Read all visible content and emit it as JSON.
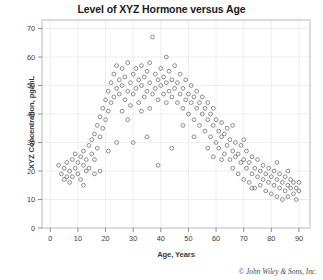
{
  "chart_data": {
    "type": "scatter",
    "title": "Level of XYZ Hormone versus Age",
    "xlabel": "Age, Years",
    "ylabel": "XYZ Concentration, pg/mL",
    "xlim": [
      -3,
      94
    ],
    "ylim": [
      0,
      73
    ],
    "xticks": [
      0,
      10,
      20,
      30,
      40,
      50,
      60,
      70,
      80,
      90
    ],
    "yticks": [
      0,
      10,
      20,
      30,
      40,
      50,
      60,
      70
    ],
    "grid": true,
    "legend": null,
    "marker": "open-circle",
    "marker_color": "#7a7a7a",
    "points": [
      [
        3,
        22
      ],
      [
        4,
        19
      ],
      [
        5,
        17
      ],
      [
        5,
        21
      ],
      [
        6,
        18
      ],
      [
        6,
        23
      ],
      [
        7,
        16
      ],
      [
        7,
        20
      ],
      [
        8,
        24
      ],
      [
        8,
        18
      ],
      [
        9,
        21
      ],
      [
        9,
        26
      ],
      [
        10,
        19
      ],
      [
        10,
        23
      ],
      [
        11,
        17
      ],
      [
        11,
        25
      ],
      [
        12,
        22
      ],
      [
        12,
        27
      ],
      [
        13,
        20
      ],
      [
        13,
        24
      ],
      [
        14,
        29
      ],
      [
        14,
        21
      ],
      [
        15,
        26
      ],
      [
        15,
        31
      ],
      [
        16,
        24
      ],
      [
        16,
        33
      ],
      [
        17,
        28
      ],
      [
        17,
        36
      ],
      [
        18,
        32
      ],
      [
        18,
        39
      ],
      [
        19,
        35
      ],
      [
        19,
        42
      ],
      [
        20,
        38
      ],
      [
        20,
        45
      ],
      [
        21,
        41
      ],
      [
        21,
        48
      ],
      [
        22,
        44
      ],
      [
        22,
        51
      ],
      [
        23,
        46
      ],
      [
        23,
        54
      ],
      [
        24,
        49
      ],
      [
        24,
        57
      ],
      [
        25,
        47
      ],
      [
        25,
        52
      ],
      [
        26,
        50
      ],
      [
        26,
        56
      ],
      [
        27,
        45
      ],
      [
        27,
        53
      ],
      [
        28,
        48
      ],
      [
        28,
        58
      ],
      [
        29,
        51
      ],
      [
        29,
        43
      ],
      [
        30,
        54
      ],
      [
        30,
        47
      ],
      [
        31,
        49
      ],
      [
        31,
        56
      ],
      [
        32,
        52
      ],
      [
        32,
        44
      ],
      [
        33,
        50
      ],
      [
        33,
        57
      ],
      [
        34,
        46
      ],
      [
        34,
        53
      ],
      [
        35,
        55
      ],
      [
        35,
        48
      ],
      [
        36,
        51
      ],
      [
        36,
        58
      ],
      [
        37,
        67
      ],
      [
        37,
        47
      ],
      [
        38,
        54
      ],
      [
        38,
        49
      ],
      [
        39,
        52
      ],
      [
        39,
        45
      ],
      [
        40,
        56
      ],
      [
        40,
        50
      ],
      [
        41,
        47
      ],
      [
        41,
        53
      ],
      [
        42,
        51
      ],
      [
        42,
        44
      ],
      [
        43,
        55
      ],
      [
        43,
        48
      ],
      [
        44,
        52
      ],
      [
        44,
        46
      ],
      [
        45,
        49
      ],
      [
        45,
        57
      ],
      [
        46,
        44
      ],
      [
        46,
        51
      ],
      [
        47,
        47
      ],
      [
        47,
        54
      ],
      [
        48,
        42
      ],
      [
        48,
        49
      ],
      [
        49,
        45
      ],
      [
        49,
        52
      ],
      [
        50,
        47
      ],
      [
        50,
        40
      ],
      [
        51,
        44
      ],
      [
        51,
        50
      ],
      [
        52,
        38
      ],
      [
        52,
        46
      ],
      [
        53,
        42
      ],
      [
        53,
        48
      ],
      [
        54,
        36
      ],
      [
        54,
        44
      ],
      [
        55,
        40
      ],
      [
        55,
        46
      ],
      [
        56,
        34
      ],
      [
        56,
        42
      ],
      [
        57,
        38
      ],
      [
        57,
        44
      ],
      [
        58,
        32
      ],
      [
        58,
        40
      ],
      [
        59,
        36
      ],
      [
        59,
        42
      ],
      [
        60,
        30
      ],
      [
        60,
        38
      ],
      [
        61,
        34
      ],
      [
        61,
        28
      ],
      [
        62,
        32
      ],
      [
        62,
        37
      ],
      [
        63,
        26
      ],
      [
        63,
        33
      ],
      [
        64,
        29
      ],
      [
        64,
        35
      ],
      [
        65,
        24
      ],
      [
        65,
        31
      ],
      [
        66,
        27
      ],
      [
        66,
        21
      ],
      [
        67,
        25
      ],
      [
        67,
        30
      ],
      [
        68,
        19
      ],
      [
        68,
        26
      ],
      [
        69,
        23
      ],
      [
        69,
        29
      ],
      [
        70,
        17
      ],
      [
        70,
        24
      ],
      [
        71,
        21
      ],
      [
        71,
        27
      ],
      [
        72,
        16
      ],
      [
        72,
        23
      ],
      [
        73,
        19
      ],
      [
        73,
        25
      ],
      [
        74,
        14
      ],
      [
        74,
        21
      ],
      [
        75,
        18
      ],
      [
        75,
        24
      ],
      [
        76,
        15
      ],
      [
        76,
        20
      ],
      [
        77,
        17
      ],
      [
        77,
        22
      ],
      [
        78,
        13
      ],
      [
        78,
        19
      ],
      [
        79,
        16
      ],
      [
        79,
        21
      ],
      [
        80,
        12
      ],
      [
        80,
        18
      ],
      [
        81,
        15
      ],
      [
        81,
        20
      ],
      [
        82,
        11
      ],
      [
        82,
        17
      ],
      [
        83,
        14
      ],
      [
        83,
        19
      ],
      [
        84,
        16
      ],
      [
        84,
        10
      ],
      [
        85,
        13
      ],
      [
        85,
        18
      ],
      [
        86,
        15
      ],
      [
        86,
        11
      ],
      [
        87,
        14
      ],
      [
        87,
        17
      ],
      [
        88,
        12
      ],
      [
        88,
        16
      ],
      [
        89,
        14
      ],
      [
        89,
        10
      ],
      [
        90,
        13
      ],
      [
        90,
        16
      ],
      [
        21,
        27
      ],
      [
        24,
        30
      ],
      [
        30,
        30
      ],
      [
        35,
        32
      ],
      [
        39,
        22
      ],
      [
        44,
        28
      ],
      [
        52,
        32
      ],
      [
        57,
        28
      ],
      [
        62,
        24
      ],
      [
        18,
        20
      ],
      [
        26,
        41
      ],
      [
        33,
        41
      ],
      [
        48,
        36
      ],
      [
        66,
        36
      ],
      [
        70,
        31
      ],
      [
        12,
        15
      ],
      [
        16,
        19
      ],
      [
        42,
        60
      ],
      [
        28,
        38
      ],
      [
        36,
        42
      ],
      [
        59,
        25
      ],
      [
        73,
        14
      ],
      [
        82,
        23
      ],
      [
        86,
        20
      ]
    ],
    "copyright": "© John Wiley & Sons, Inc."
  }
}
